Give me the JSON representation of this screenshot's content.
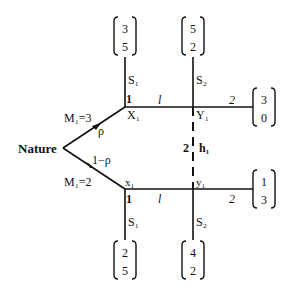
{
  "diagram": {
    "root_label": "Nature",
    "branches": [
      {
        "move_label": "M₁=3",
        "prob": "ρ",
        "node1": {
          "label": "X₁",
          "player": "1"
        },
        "node2": {
          "label": "Y₁",
          "player": ""
        },
        "edge_1_label": "l",
        "edge_2_label": "2",
        "payoffs": {
          "S1": [
            "3",
            "5"
          ],
          "S2": [
            "5",
            "2"
          ],
          "end": [
            "3",
            "0"
          ]
        },
        "stop_labels": {
          "S1": "S₁",
          "S2": "S₂"
        }
      },
      {
        "move_label": "M₁=2",
        "prob": "1−ρ",
        "node1": {
          "label": "x₁",
          "player": "1"
        },
        "node2": {
          "label": "y₁",
          "player": ""
        },
        "edge_1_label": "l",
        "edge_2_label": "2",
        "payoffs": {
          "S1": [
            "2",
            "5"
          ],
          "S2": [
            "4",
            "2"
          ],
          "end": [
            "1",
            "3"
          ]
        },
        "stop_labels": {
          "S1": "S₁",
          "S2": "S₂"
        }
      }
    ],
    "info_set": {
      "player": "2",
      "label": "h₁"
    }
  }
}
